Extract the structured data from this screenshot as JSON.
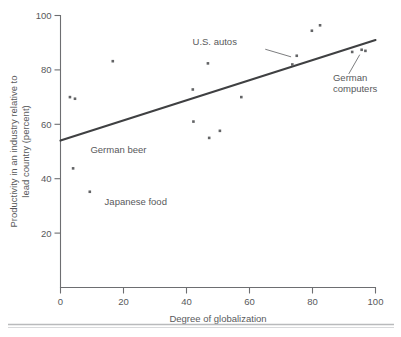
{
  "chart_data": {
    "type": "scatter",
    "title": "",
    "xlabel": "Degree of globalization",
    "ylabel_line1": "Productivity in an industry relative to",
    "ylabel_line2": "lead country (percent)",
    "xlim": [
      0,
      100
    ],
    "ylim": [
      0,
      100
    ],
    "xticks": [
      0,
      20,
      40,
      60,
      80,
      100
    ],
    "xticklabels": [
      "0",
      "20",
      "40",
      "60",
      "80",
      "100"
    ],
    "yticks": [
      20,
      40,
      60,
      80,
      100
    ],
    "yticklabels": [
      "20",
      "40",
      "60",
      "80",
      "100"
    ],
    "grid": false,
    "legend": false,
    "points": [
      {
        "x": 3.0,
        "y": 70.0
      },
      {
        "x": 4.6,
        "y": 69.4
      },
      {
        "x": 4.0,
        "y": 43.8
      },
      {
        "x": 9.3,
        "y": 35.2
      },
      {
        "x": 16.6,
        "y": 83.2
      },
      {
        "x": 42.0,
        "y": 72.8
      },
      {
        "x": 42.2,
        "y": 61.0
      },
      {
        "x": 46.8,
        "y": 82.4
      },
      {
        "x": 47.2,
        "y": 55.0
      },
      {
        "x": 50.6,
        "y": 57.6
      },
      {
        "x": 57.4,
        "y": 70.0
      },
      {
        "x": 73.6,
        "y": 82.0
      },
      {
        "x": 75.0,
        "y": 85.2
      },
      {
        "x": 79.8,
        "y": 94.4
      },
      {
        "x": 82.4,
        "y": 96.4
      },
      {
        "x": 92.6,
        "y": 86.6
      },
      {
        "x": 95.6,
        "y": 87.4
      },
      {
        "x": 96.8,
        "y": 87.0
      }
    ],
    "trend_line": {
      "x0": 0,
      "y0": 54.0,
      "x1": 100,
      "y1": 91.0
    },
    "annotations": [
      {
        "label": "U.S. autos",
        "text_x": 56.0,
        "text_y": 89.0,
        "anchor": "end",
        "leader": {
          "x1": 65.0,
          "y1": 87.6,
          "x2": 73.2,
          "y2": 84.8
        }
      },
      {
        "label": "German beer",
        "text_x": 9.5,
        "text_y": 49.5,
        "anchor": "start",
        "leader": null
      },
      {
        "label": "Japanese food",
        "text_x": 14.0,
        "text_y": 30.2,
        "anchor": "start",
        "leader": null
      },
      {
        "label_line1": "German",
        "label_line2": "computers",
        "text_x": 86.5,
        "text_y": 76.0,
        "anchor": "start",
        "leader": {
          "x1": 91.5,
          "y1": 78.5,
          "x2": 95.0,
          "y2": 85.6
        }
      }
    ],
    "colors": {
      "axis": "#6d6e71",
      "text": "#58595b",
      "marker": "#636466",
      "trend": "#3f4042",
      "footer_rule": "#b9babc",
      "background": "#ffffff"
    }
  }
}
